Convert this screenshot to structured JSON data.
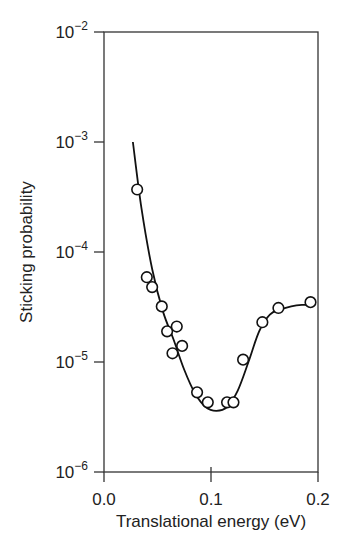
{
  "chart_data": {
    "type": "scatter",
    "title": "",
    "xlabel": "Translational energy (eV)",
    "ylabel": "Sticking probability",
    "xlim": [
      0.0,
      0.2
    ],
    "ylim": [
      1e-06,
      0.01
    ],
    "yscale": "log",
    "grid": false,
    "legend": null,
    "x_ticks": [
      0.0,
      0.1,
      0.2
    ],
    "x_tick_labels": [
      "0.0",
      "0.1",
      "0.2"
    ],
    "y_ticks": [
      0.01,
      0.001,
      0.0001,
      1e-05,
      1e-06
    ],
    "y_tick_labels": [
      {
        "base": "10",
        "exp": "−2"
      },
      {
        "base": "10",
        "exp": "−3"
      },
      {
        "base": "10",
        "exp": "−4"
      },
      {
        "base": "10",
        "exp": "−5"
      },
      {
        "base": "10",
        "exp": "−6"
      }
    ],
    "series": [
      {
        "name": "measured",
        "style": "open-circle",
        "x": [
          0.031,
          0.04,
          0.045,
          0.054,
          0.059,
          0.068,
          0.064,
          0.073,
          0.087,
          0.097,
          0.115,
          0.121,
          0.13,
          0.148,
          0.163,
          0.193
        ],
        "y": [
          0.00037,
          5.9e-05,
          4.8e-05,
          3.2e-05,
          1.9e-05,
          2.1e-05,
          1.2e-05,
          1.4e-05,
          5.3e-06,
          4.3e-06,
          4.3e-06,
          4.3e-06,
          1.05e-05,
          2.3e-05,
          3.1e-05,
          3.5e-05
        ]
      },
      {
        "name": "fit",
        "style": "line",
        "x": [
          0.027,
          0.035,
          0.045,
          0.055,
          0.065,
          0.075,
          0.085,
          0.095,
          0.105,
          0.115,
          0.125,
          0.135,
          0.145,
          0.155,
          0.165,
          0.175,
          0.185,
          0.195
        ],
        "y": [
          0.001,
          0.00025,
          7e-05,
          2.9e-05,
          1.6e-05,
          8.5e-06,
          5.2e-06,
          3.9e-06,
          3.6e-06,
          3.9e-06,
          5.5e-06,
          1e-05,
          1.9e-05,
          2.7e-05,
          3e-05,
          3.2e-05,
          3.3e-05,
          3.3e-05
        ]
      }
    ]
  }
}
